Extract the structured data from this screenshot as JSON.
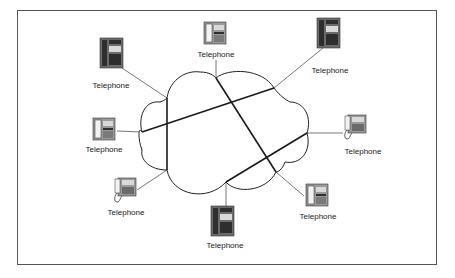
{
  "diagram": {
    "type": "network-cloud",
    "frame": {
      "x": 17,
      "y": 10,
      "width": 419,
      "height": 254,
      "stroke": "#555555"
    },
    "cloud": {
      "stroke": "#222222",
      "fill": "#ffffff"
    },
    "colors": {
      "link": "#1a1a1a",
      "spoke": "#555555",
      "phone_body": "#6b6b6b",
      "phone_dark": "#2e2e2e",
      "phone_light": "#d9d9d9"
    },
    "nodes": [
      {
        "id": "phone-top-left",
        "label": "Telephone",
        "icon": "desk-telephone-icon",
        "style": "tall",
        "x": 100,
        "y": 38,
        "label_x": 111,
        "label_y": 88
      },
      {
        "id": "phone-top",
        "label": "Telephone",
        "icon": "desk-telephone-icon",
        "style": "square",
        "x": 204,
        "y": 22,
        "label_x": 216,
        "label_y": 57
      },
      {
        "id": "phone-top-right",
        "label": "Telephone",
        "icon": "desk-telephone-icon",
        "style": "tall",
        "x": 317,
        "y": 18,
        "label_x": 330,
        "label_y": 73
      },
      {
        "id": "phone-left",
        "label": "Telephone",
        "icon": "desk-telephone-icon",
        "style": "square",
        "x": 93,
        "y": 118,
        "label_x": 104,
        "label_y": 152
      },
      {
        "id": "phone-right",
        "label": "Telephone",
        "icon": "corded-telephone-icon",
        "style": "corded",
        "x": 342,
        "y": 115,
        "label_x": 363,
        "label_y": 154
      },
      {
        "id": "phone-bottom-left",
        "label": "Telephone",
        "icon": "corded-telephone-icon",
        "style": "corded",
        "x": 112,
        "y": 178,
        "label_x": 126,
        "label_y": 215
      },
      {
        "id": "phone-bottom",
        "label": "Telephone",
        "icon": "desk-telephone-icon",
        "style": "tall",
        "x": 211,
        "y": 206,
        "label_x": 225,
        "label_y": 248
      },
      {
        "id": "phone-bottom-right",
        "label": "Telephone",
        "icon": "desk-telephone-icon",
        "style": "square",
        "x": 306,
        "y": 184,
        "label_x": 318,
        "label_y": 219
      }
    ],
    "spokes": [
      {
        "from": "phone-top-left",
        "x1": 122,
        "y1": 68,
        "x2": 167,
        "y2": 98
      },
      {
        "from": "phone-top",
        "x1": 216,
        "y1": 60,
        "x2": 216,
        "y2": 78
      },
      {
        "from": "phone-top-right",
        "x1": 323,
        "y1": 48,
        "x2": 274,
        "y2": 88
      },
      {
        "from": "phone-left",
        "x1": 117,
        "y1": 131,
        "x2": 142,
        "y2": 132
      },
      {
        "from": "phone-right",
        "x1": 343,
        "y1": 133,
        "x2": 307,
        "y2": 133
      },
      {
        "from": "phone-bottom-left",
        "x1": 137,
        "y1": 190,
        "x2": 167,
        "y2": 170
      },
      {
        "from": "phone-bottom",
        "x1": 226,
        "y1": 182,
        "x2": 226,
        "y2": 206
      },
      {
        "from": "phone-bottom-right",
        "x1": 304,
        "y1": 196,
        "x2": 276,
        "y2": 172
      }
    ],
    "links": [
      {
        "name": "top-left-to-bottom-left",
        "x1": 167,
        "y1": 98,
        "x2": 167,
        "y2": 170
      },
      {
        "name": "left-to-top-right",
        "x1": 142,
        "y1": 132,
        "x2": 274,
        "y2": 88
      },
      {
        "name": "top-to-bottom-right",
        "x1": 216,
        "y1": 78,
        "x2": 276,
        "y2": 172
      },
      {
        "name": "bottom-to-right",
        "x1": 226,
        "y1": 182,
        "x2": 307,
        "y2": 133
      }
    ]
  }
}
